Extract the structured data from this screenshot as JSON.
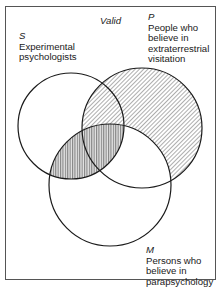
{
  "diagram": {
    "type": "venn-3-set",
    "title": "Valid",
    "sets": [
      {
        "symbol": "S",
        "lines": [
          "Experimental",
          "psychologists"
        ],
        "circle": {
          "cx": 71,
          "cy": 126,
          "r": 53
        }
      },
      {
        "symbol": "P",
        "lines": [
          "People who",
          "believe in",
          "extraterrestrial",
          "visitation"
        ],
        "circle": {
          "cx": 142,
          "cy": 128,
          "r": 60
        }
      },
      {
        "symbol": "M",
        "lines": [
          "Persons who",
          "believe in",
          "parapsychology"
        ],
        "circle": {
          "cx": 110,
          "cy": 185,
          "r": 61
        }
      }
    ],
    "shading": {
      "diagonal": [
        "P only",
        "S∩P outside M"
      ],
      "vertical": [
        "S∩M",
        "S∩P∩M"
      ],
      "unshaded": [
        "S only",
        "M only",
        "P∩M outside S"
      ]
    },
    "colors": {
      "stroke": "#1a1a1a",
      "hatch": "#6b6b6b",
      "frame": "#555555",
      "background": "#ffffff"
    }
  }
}
